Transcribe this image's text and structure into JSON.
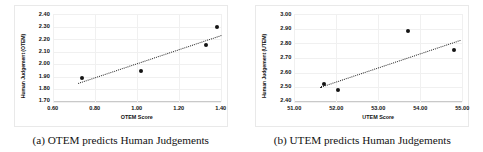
{
  "figure": {
    "subfigures": [
      {
        "caption": "(a) OTEM predicts Human Judgements",
        "chart_data": {
          "type": "scatter",
          "title": "",
          "xlabel": "OTEM Score",
          "ylabel": "Human Judgement (OTEM)",
          "xlim": [
            0.6,
            1.4
          ],
          "ylim": [
            1.7,
            2.4
          ],
          "xticks": [
            "0.60",
            "0.80",
            "1.00",
            "1.20",
            "1.40"
          ],
          "xtick_values": [
            0.6,
            0.8,
            1.0,
            1.2,
            1.4
          ],
          "yticks": [
            "2.40",
            "2.30",
            "2.20",
            "2.10",
            "2.00",
            "1.90",
            "1.80",
            "1.70"
          ],
          "ytick_values": [
            2.4,
            2.3,
            2.2,
            2.1,
            2.0,
            1.9,
            1.8,
            1.7
          ],
          "grid": true,
          "legend": "none",
          "points": [
            {
              "x": 0.74,
              "y": 1.89
            },
            {
              "x": 1.02,
              "y": 1.945
            },
            {
              "x": 1.33,
              "y": 2.15
            },
            {
              "x": 1.38,
              "y": 2.3
            }
          ],
          "trendline": {
            "style": "dotted",
            "x0": 0.72,
            "y0": 1.855,
            "x1": 1.4,
            "y1": 2.235
          }
        }
      },
      {
        "caption": "(b) UTEM predicts Human Judgements",
        "chart_data": {
          "type": "scatter",
          "title": "",
          "xlabel": "UTEM Score",
          "ylabel": "Human Judgement (UTEM)",
          "xlim": [
            51.0,
            55.0
          ],
          "ylim": [
            2.4,
            3.0
          ],
          "xticks": [
            "51.00",
            "52.00",
            "53.00",
            "54.00",
            "55.00"
          ],
          "xtick_values": [
            51.0,
            52.0,
            53.0,
            54.0,
            55.0
          ],
          "yticks": [
            "3.00",
            "2.90",
            "2.80",
            "2.70",
            "2.60",
            "2.50",
            "2.40"
          ],
          "ytick_values": [
            3.0,
            2.9,
            2.8,
            2.7,
            2.6,
            2.5,
            2.4
          ],
          "grid": true,
          "legend": "none",
          "points": [
            {
              "x": 51.7,
              "y": 2.52
            },
            {
              "x": 52.05,
              "y": 2.48
            },
            {
              "x": 53.7,
              "y": 2.885
            },
            {
              "x": 54.8,
              "y": 2.755
            }
          ],
          "trendline": {
            "style": "dotted",
            "x0": 51.62,
            "y0": 2.505,
            "x1": 54.95,
            "y1": 2.825
          }
        }
      }
    ]
  },
  "colors": {
    "marker": "#141414",
    "trendline": "#2a2a2a",
    "grid": "#f0f0f0",
    "frame": "#e9e9e9",
    "text": "#111111",
    "background": "#ffffff"
  }
}
